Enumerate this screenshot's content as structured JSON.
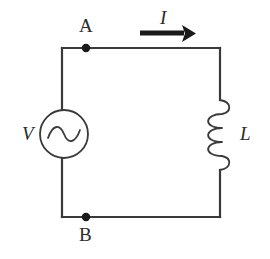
{
  "figure": {
    "kind": "circuit-diagram",
    "background_color": "#ffffff",
    "line_color": "#3a3a3a",
    "label_color": "#2b2b2b",
    "arrow_color": "#1a1a1a"
  },
  "labels": {
    "node_a": "A",
    "node_b": "B",
    "source": "V",
    "current": "I",
    "inductor": "L"
  },
  "components": {
    "source": {
      "name": "ac-voltage-source",
      "symbol": "circle-with-sine-wave",
      "center_x": 64,
      "center_y": 134,
      "radius": 24
    },
    "inductor": {
      "name": "inductor-coil",
      "symbol": "coil-three-loops",
      "center_x": 220,
      "center_y": 134,
      "loops": 3
    },
    "nodes": [
      {
        "label": "A",
        "x": 86,
        "y": 48
      },
      {
        "label": "B",
        "x": 86,
        "y": 217
      }
    ],
    "current_arrow": {
      "direction": "right",
      "x_start": 140,
      "x_end": 192,
      "y": 33
    },
    "loop": {
      "left": 62,
      "right": 220,
      "top": 48,
      "bottom": 217
    }
  }
}
